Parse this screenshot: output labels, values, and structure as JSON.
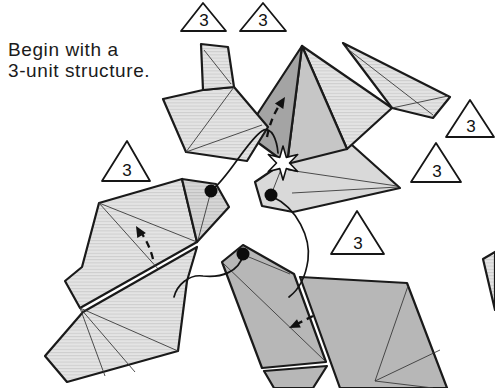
{
  "caption": {
    "line1": "Begin with a",
    "line2": "3-unit structure."
  },
  "markers": [
    {
      "label": "3"
    },
    {
      "label": "3"
    },
    {
      "label": "3"
    },
    {
      "label": "3"
    },
    {
      "label": "3"
    },
    {
      "label": "3"
    }
  ],
  "colors": {
    "background": "#ffffff",
    "outline": "#1a1a1a",
    "paper_light": "#e2e2e2",
    "paper_mid": "#c6c6c6",
    "paper_dark": "#a4a4a4",
    "paper_plain": "#d9d9d9",
    "diamond_gray": "#b7b7b7"
  }
}
